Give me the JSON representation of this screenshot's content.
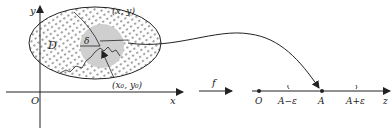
{
  "diagram": {
    "left_plane": {
      "y_axis_label": "y",
      "x_axis_label": "x",
      "origin_label": "O",
      "region_label": "D",
      "point_label": "(x, y)",
      "center_label": "(x₀, y₀)",
      "radius_label": "δ"
    },
    "mapping_label": "f",
    "number_line": {
      "origin_label": "O",
      "left_bound_label": "A−ε",
      "center_label": "A",
      "right_bound_label": "A+ε",
      "axis_label": "z"
    },
    "colors": {
      "stroke": "#222222",
      "neighborhood_fill": "#cfcfcf",
      "background": "#ffffff"
    }
  }
}
